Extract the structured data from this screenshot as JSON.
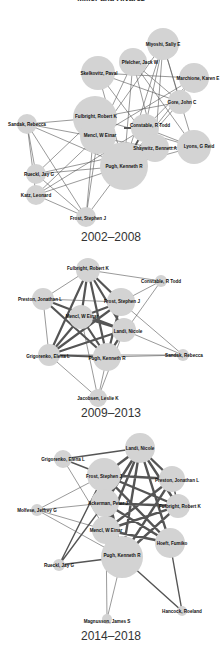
{
  "figure": {
    "top_caption_partial": "Miller and Alvarez",
    "panels": [
      {
        "period": "2002–2008",
        "nodes": [
          {
            "name": "Miyoshi, Sally E",
            "x": 163,
            "y": 44,
            "r": 16
          },
          {
            "name": "Pfelcher, Jack W",
            "x": 133,
            "y": 62,
            "r": 14
          },
          {
            "name": "Skelkovitz, Paval",
            "x": 98,
            "y": 73,
            "r": 17
          },
          {
            "name": "Marchione, Karen E",
            "x": 194,
            "y": 78,
            "r": 15
          },
          {
            "name": "Gore, John C",
            "x": 180,
            "y": 102,
            "r": 12
          },
          {
            "name": "Fulbright, Robert K",
            "x": 95,
            "y": 118,
            "r": 22
          },
          {
            "name": "Constable, R Todd",
            "x": 145,
            "y": 128,
            "r": 14
          },
          {
            "name": "Mencl, W Einar",
            "x": 98,
            "y": 136,
            "r": 18
          },
          {
            "name": "Sandak, Rebecca",
            "x": 27,
            "y": 124,
            "r": 10
          },
          {
            "name": "Shaywitz, Bennett A",
            "x": 155,
            "y": 148,
            "r": 14
          },
          {
            "name": "Lyons, G Reid",
            "x": 194,
            "y": 147,
            "r": 17
          },
          {
            "name": "Pugh, Kenneth R",
            "x": 124,
            "y": 166,
            "r": 24
          },
          {
            "name": "Rueckl, Jay G",
            "x": 36,
            "y": 174,
            "r": 10
          },
          {
            "name": "Katz, Leonard",
            "x": 36,
            "y": 195,
            "r": 10
          },
          {
            "name": "Frost, Stephen J",
            "x": 86,
            "y": 217,
            "r": 10
          }
        ]
      },
      {
        "period": "2009–2013",
        "nodes": [
          {
            "name": "Fulbright, Robert K",
            "x": 88,
            "y": 270,
            "r": 12
          },
          {
            "name": "Constable, R Todd",
            "x": 161,
            "y": 281,
            "r": 6
          },
          {
            "name": "Preston, Jonathan L",
            "x": 43,
            "y": 299,
            "r": 11
          },
          {
            "name": "Frost, Stephen J",
            "x": 121,
            "y": 302,
            "r": 14
          },
          {
            "name": "Mencl, W Einar",
            "x": 81,
            "y": 317,
            "r": 12
          },
          {
            "name": "Landi, Nicole",
            "x": 124,
            "y": 330,
            "r": 12
          },
          {
            "name": "Grigorenko, Elena L",
            "x": 49,
            "y": 355,
            "r": 11
          },
          {
            "name": "Pugh, Kenneth R",
            "x": 107,
            "y": 357,
            "r": 14
          },
          {
            "name": "Sandak, Rebecca",
            "x": 183,
            "y": 355,
            "r": 6
          },
          {
            "name": "Jacobsen, Leslie K",
            "x": 98,
            "y": 398,
            "r": 9
          }
        ]
      },
      {
        "period": "2014–2018",
        "nodes": [
          {
            "name": "Landi, Nicole",
            "x": 140,
            "y": 448,
            "r": 15
          },
          {
            "name": "Grigorenko, Elena L",
            "x": 63,
            "y": 459,
            "r": 9
          },
          {
            "name": "Frost, Stephen J",
            "x": 104,
            "y": 475,
            "r": 17
          },
          {
            "name": "Preston, Jonathan L",
            "x": 172,
            "y": 479,
            "r": 13
          },
          {
            "name": "Ackerman, Peter J",
            "x": 105,
            "y": 503,
            "r": 14
          },
          {
            "name": "Fulbright, Robert K",
            "x": 178,
            "y": 506,
            "r": 12
          },
          {
            "name": "Molfese, Jeffrey G",
            "x": 37,
            "y": 510,
            "r": 6
          },
          {
            "name": "Mencl, W Einar",
            "x": 106,
            "y": 530,
            "r": 14
          },
          {
            "name": "Hoeft, Fumiko",
            "x": 170,
            "y": 543,
            "r": 15
          },
          {
            "name": "Pugh, Kenneth R",
            "x": 122,
            "y": 557,
            "r": 21
          },
          {
            "name": "Rueckl, Jay G",
            "x": 59,
            "y": 565,
            "r": 6
          },
          {
            "name": "Hancock, Roeland",
            "x": 182,
            "y": 611,
            "r": 5
          },
          {
            "name": "Magnusson, James S",
            "x": 107,
            "y": 619,
            "r": 5
          }
        ]
      }
    ]
  }
}
